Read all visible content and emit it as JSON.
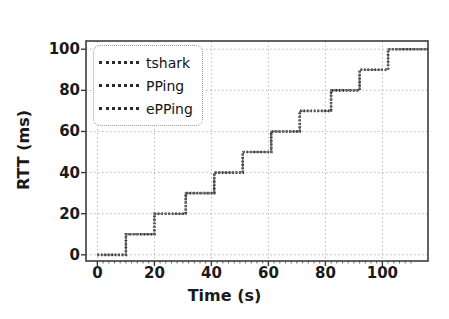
{
  "chart_data": {
    "type": "line",
    "title": "",
    "xlabel": "Time (s)",
    "ylabel": "RTT (ms)",
    "xlim": [
      -4,
      116
    ],
    "ylim": [
      -3,
      104
    ],
    "xticks": [
      0,
      20,
      40,
      60,
      80,
      100
    ],
    "yticks": [
      0,
      20,
      40,
      60,
      80,
      100
    ],
    "grid": true,
    "legend_position": "upper left",
    "drawstyle": "steps-post",
    "series": [
      {
        "name": "tshark",
        "color": "#2b2b2b",
        "linestyle": "dotted",
        "x": [
          0,
          10,
          20,
          31,
          41,
          51,
          61,
          71,
          82,
          92,
          102,
          116
        ],
        "y": [
          0,
          10,
          20,
          30,
          40,
          50,
          60,
          70,
          80,
          90,
          100,
          100
        ]
      },
      {
        "name": "PPing",
        "color": "#4a4a4a",
        "linestyle": "dotted",
        "x": [
          0,
          10,
          20,
          31,
          41,
          51,
          61,
          71,
          82,
          92,
          102,
          116
        ],
        "y": [
          0,
          10,
          20,
          30,
          40,
          50,
          60,
          70,
          80,
          90,
          100,
          100
        ]
      },
      {
        "name": "ePPing",
        "color": "#6b6b6b",
        "linestyle": "dotted",
        "x": [
          0,
          10,
          20,
          31,
          41,
          51,
          61,
          71,
          82,
          92,
          102,
          116
        ],
        "y": [
          0,
          10,
          20,
          30,
          40,
          50,
          60,
          70,
          80,
          90,
          100,
          100
        ]
      }
    ]
  },
  "legend": {
    "entries": [
      {
        "label": "tshark"
      },
      {
        "label": "PPing"
      },
      {
        "label": "ePPing"
      }
    ]
  },
  "axes": {
    "xlabel": "Time (s)",
    "ylabel": "RTT (ms)",
    "xtick_labels": [
      "0",
      "20",
      "40",
      "60",
      "80",
      "100"
    ],
    "ytick_labels": [
      "0",
      "20",
      "40",
      "60",
      "80",
      "100"
    ]
  },
  "colors": {
    "line": "#2b2b2b",
    "grid": "#b9b9b9",
    "spine": "#3c3c3c",
    "background": "#ffffff"
  }
}
